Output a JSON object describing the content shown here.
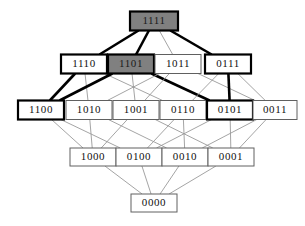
{
  "diagram": {
    "background_color": "#ffffff",
    "edge_color": "#9a9a9a",
    "bold_edge_color": "#000000",
    "filled_node_color": "#808080",
    "node_fill_color": "#ffffff",
    "node_border_color": "#606060",
    "node_border_color_thick": "#000000",
    "nodes": [
      {
        "id": "1111",
        "label": "1111",
        "x": 154,
        "y": 21,
        "w": 48,
        "h": 19,
        "style": "filled-thick",
        "level": 4
      },
      {
        "id": "1110",
        "label": "1110",
        "x": 84,
        "y": 64,
        "w": 46,
        "h": 19,
        "style": "thick",
        "level": 3
      },
      {
        "id": "1101",
        "label": "1101",
        "x": 131,
        "y": 64,
        "w": 46,
        "h": 19,
        "style": "filled-thick",
        "level": 3
      },
      {
        "id": "1011",
        "label": "1011",
        "x": 178,
        "y": 64,
        "w": 46,
        "h": 19,
        "style": "thin",
        "level": 3
      },
      {
        "id": "0111",
        "label": "0111",
        "x": 228,
        "y": 64,
        "w": 46,
        "h": 19,
        "style": "thick",
        "level": 3
      },
      {
        "id": "1100",
        "label": "1100",
        "x": 41,
        "y": 110,
        "w": 46,
        "h": 19,
        "style": "thick",
        "level": 2
      },
      {
        "id": "1010",
        "label": "1010",
        "x": 89,
        "y": 110,
        "w": 46,
        "h": 19,
        "style": "thin",
        "level": 2
      },
      {
        "id": "1001",
        "label": "1001",
        "x": 136,
        "y": 110,
        "w": 46,
        "h": 19,
        "style": "thin",
        "level": 2
      },
      {
        "id": "0110",
        "label": "0110",
        "x": 183,
        "y": 110,
        "w": 46,
        "h": 19,
        "style": "thin",
        "level": 2
      },
      {
        "id": "0101",
        "label": "0101",
        "x": 230,
        "y": 110,
        "w": 46,
        "h": 19,
        "style": "thick",
        "level": 2
      },
      {
        "id": "0011",
        "label": "0011",
        "x": 275,
        "y": 110,
        "w": 44,
        "h": 19,
        "style": "thin",
        "level": 2
      },
      {
        "id": "1000",
        "label": "1000",
        "x": 93,
        "y": 157,
        "w": 46,
        "h": 18,
        "style": "thin",
        "level": 1
      },
      {
        "id": "0100",
        "label": "0100",
        "x": 139,
        "y": 157,
        "w": 46,
        "h": 18,
        "style": "thin",
        "level": 1
      },
      {
        "id": "0010",
        "label": "0010",
        "x": 185,
        "y": 157,
        "w": 46,
        "h": 18,
        "style": "thin",
        "level": 1
      },
      {
        "id": "0001",
        "label": "0001",
        "x": 231,
        "y": 157,
        "w": 46,
        "h": 18,
        "style": "thin",
        "level": 1
      },
      {
        "id": "0000",
        "label": "0000",
        "x": 154,
        "y": 203,
        "w": 46,
        "h": 18,
        "style": "thin",
        "level": 0
      }
    ],
    "edges": [
      {
        "from": "1111",
        "to": "1110",
        "bold": true
      },
      {
        "from": "1111",
        "to": "1101",
        "bold": true
      },
      {
        "from": "1111",
        "to": "1011",
        "bold": false
      },
      {
        "from": "1111",
        "to": "0111",
        "bold": true
      },
      {
        "from": "1110",
        "to": "1100",
        "bold": true
      },
      {
        "from": "1110",
        "to": "1010",
        "bold": false
      },
      {
        "from": "1110",
        "to": "0110",
        "bold": false
      },
      {
        "from": "1101",
        "to": "1100",
        "bold": true
      },
      {
        "from": "1101",
        "to": "1001",
        "bold": false
      },
      {
        "from": "1101",
        "to": "0101",
        "bold": true
      },
      {
        "from": "1011",
        "to": "1010",
        "bold": false
      },
      {
        "from": "1011",
        "to": "1001",
        "bold": false
      },
      {
        "from": "1011",
        "to": "0011",
        "bold": false
      },
      {
        "from": "0111",
        "to": "0110",
        "bold": false
      },
      {
        "from": "0111",
        "to": "0101",
        "bold": true
      },
      {
        "from": "0111",
        "to": "0011",
        "bold": false
      },
      {
        "from": "1100",
        "to": "1000",
        "bold": false
      },
      {
        "from": "1100",
        "to": "0100",
        "bold": false
      },
      {
        "from": "1010",
        "to": "1000",
        "bold": false
      },
      {
        "from": "1010",
        "to": "0010",
        "bold": false
      },
      {
        "from": "1001",
        "to": "1000",
        "bold": false
      },
      {
        "from": "1001",
        "to": "0001",
        "bold": false
      },
      {
        "from": "0110",
        "to": "0100",
        "bold": false
      },
      {
        "from": "0110",
        "to": "0010",
        "bold": false
      },
      {
        "from": "0101",
        "to": "0100",
        "bold": false
      },
      {
        "from": "0101",
        "to": "0001",
        "bold": false
      },
      {
        "from": "0011",
        "to": "0010",
        "bold": false
      },
      {
        "from": "0011",
        "to": "0001",
        "bold": false
      },
      {
        "from": "1000",
        "to": "0000",
        "bold": false
      },
      {
        "from": "0100",
        "to": "0000",
        "bold": false
      },
      {
        "from": "0010",
        "to": "0000",
        "bold": false
      },
      {
        "from": "0001",
        "to": "0000",
        "bold": false
      }
    ]
  }
}
